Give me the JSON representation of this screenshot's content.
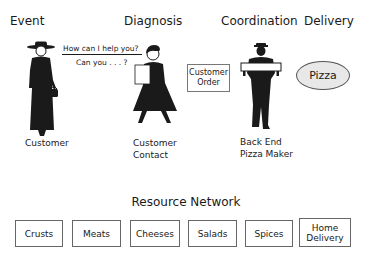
{
  "stages": {
    "event": "Event",
    "diagnosis": "Diagnosis",
    "coordination": "Coordination",
    "delivery": "Delivery"
  },
  "dialogue": {
    "line1": "How can I help you?",
    "line2": "Can you . . . ?"
  },
  "customer_order_box": {
    "line1": "Customer",
    "line2": "Order"
  },
  "pizza_label": "Pizza",
  "roles": {
    "customer": "Customer",
    "contact_line1": "Customer",
    "contact_line2": "Contact",
    "maker_line1": "Back End",
    "maker_line2": "Pizza Maker"
  },
  "resource_network": {
    "title": "Resource Network",
    "items": [
      {
        "line1": "Crusts",
        "line2": ""
      },
      {
        "line1": "Meats",
        "line2": ""
      },
      {
        "line1": "Cheeses",
        "line2": ""
      },
      {
        "line1": "Salads",
        "line2": ""
      },
      {
        "line1": "Spices",
        "line2": ""
      },
      {
        "line1": "Home",
        "line2": "Delivery"
      }
    ]
  },
  "figures": [
    "woman-with-hat-icon",
    "server-with-menu-icon",
    "pizza-carrier-icon"
  ],
  "colors": {
    "ink": "#1a1a1a",
    "pizza_fill": "#e8e8e8",
    "box_border": "#666666"
  }
}
